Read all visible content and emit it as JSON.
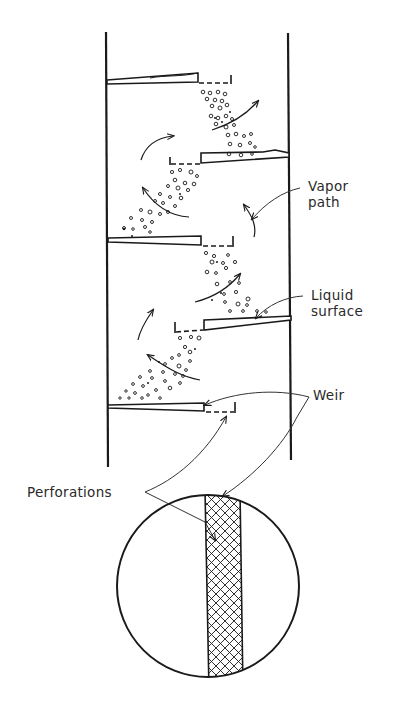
{
  "diagram": {
    "type": "sieve-tray distillation column cross-section",
    "labels": {
      "vapor_path": [
        "Vapor",
        "path"
      ],
      "liquid_surface": [
        "Liquid",
        "surface"
      ],
      "weir": "Weir",
      "perforations": "Perforations"
    },
    "colors": {
      "line": "#1a1a1a",
      "leader": "#333333",
      "background": "#ffffff"
    },
    "trays": [
      {
        "side": "left",
        "y": 78,
        "weir_x": 231
      },
      {
        "side": "right",
        "y": 157,
        "weir_x": 170
      },
      {
        "side": "left",
        "y": 240,
        "weir_x": 233
      },
      {
        "side": "right",
        "y": 322,
        "weir_x": 175
      },
      {
        "side": "left",
        "y": 406,
        "weir_x": 235
      }
    ],
    "detail": {
      "shape": "circle",
      "content": "perforated plate strip (cross-hatched)"
    }
  }
}
